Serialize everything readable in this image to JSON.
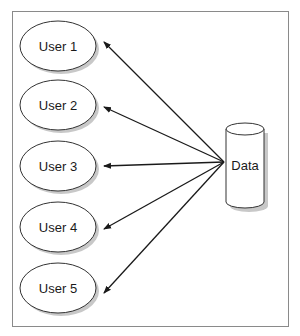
{
  "diagram": {
    "users": [
      {
        "label": "User 1",
        "cx": 58,
        "cy": 46
      },
      {
        "label": "User 2",
        "cx": 58,
        "cy": 105
      },
      {
        "label": "User 3",
        "cx": 58,
        "cy": 166
      },
      {
        "label": "User 4",
        "cx": 58,
        "cy": 227
      },
      {
        "label": "User 5",
        "cx": 58,
        "cy": 288
      }
    ],
    "data_store": {
      "label": "Data"
    },
    "colors": {
      "stroke": "#333333",
      "fill": "#ffffff",
      "shadow": "#bdbdbd",
      "border": "#8a8a8a"
    }
  }
}
